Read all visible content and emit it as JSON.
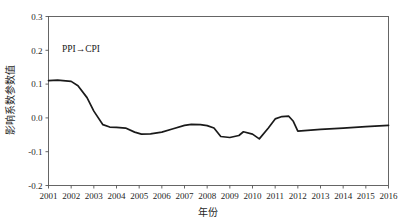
{
  "chart_data": {
    "type": "line",
    "title": "",
    "subtitle": "",
    "xlabel": "年份",
    "ylabel": "影响系数参数值",
    "annotation": "PPI→CPI",
    "grid": false,
    "legend_position": "none",
    "xlim": [
      2001,
      2016
    ],
    "ylim": [
      -0.2,
      0.3
    ],
    "yticks": [
      "0.3",
      "0.2",
      "0.1",
      "0.0",
      "-0.1",
      "-0.2"
    ],
    "ytick_values": [
      0.3,
      0.2,
      0.1,
      0.0,
      -0.1,
      -0.2
    ],
    "xticks": [
      "2001",
      "2002",
      "2003",
      "2004",
      "2005",
      "2006",
      "2007",
      "2008",
      "2009",
      "2010",
      "2011",
      "2012",
      "2013",
      "2014",
      "2015",
      "2016"
    ],
    "series": [
      {
        "name": "PPI→CPI",
        "color": "#1a1a1a",
        "x": [
          2001.0,
          2001.4,
          2002.0,
          2002.3,
          2002.7,
          2003.0,
          2003.4,
          2003.7,
          2004.0,
          2004.4,
          2004.8,
          2005.1,
          2005.5,
          2006.0,
          2006.5,
          2007.0,
          2007.3,
          2007.7,
          2008.0,
          2008.3,
          2008.6,
          2009.0,
          2009.4,
          2009.6,
          2010.0,
          2010.3,
          2010.7,
          2011.0,
          2011.3,
          2011.6,
          2011.8,
          2012.0,
          2013.0,
          2014.0,
          2015.0,
          2016.0
        ],
        "y": [
          0.11,
          0.112,
          0.108,
          0.095,
          0.06,
          0.02,
          -0.02,
          -0.027,
          -0.028,
          -0.03,
          -0.042,
          -0.048,
          -0.047,
          -0.042,
          -0.032,
          -0.022,
          -0.019,
          -0.02,
          -0.023,
          -0.03,
          -0.055,
          -0.058,
          -0.052,
          -0.041,
          -0.048,
          -0.062,
          -0.03,
          -0.003,
          0.004,
          0.005,
          -0.01,
          -0.039,
          -0.034,
          -0.03,
          -0.026,
          -0.022
        ]
      }
    ]
  },
  "axes": {
    "y_axis_label": "影响系数参数值",
    "x_axis_label": "年份"
  }
}
